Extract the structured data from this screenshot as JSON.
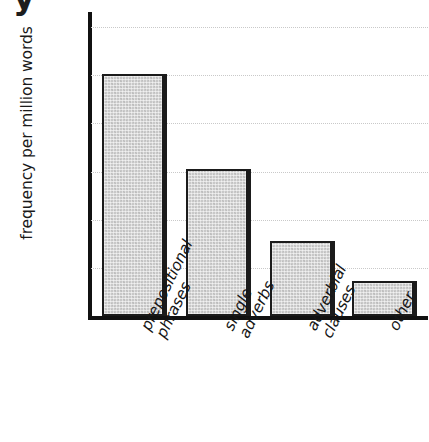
{
  "figure": {
    "cropped_caption_glyph": "y",
    "background_color": "#ffffff",
    "bar_fill_color": "#c8c8c8",
    "bar_edge_color": "#1b1b1b",
    "gridline_color": "#c9c9c9",
    "axis_color": "#111111"
  },
  "chart_data": {
    "type": "bar",
    "title": "",
    "xlabel": "",
    "ylabel": "frequency per million words",
    "categories": [
      "prepositional\nphrases",
      "single\nadverbs",
      "adverbial\nclauses",
      "other"
    ],
    "category_lines": [
      [
        "prepositional",
        "phrases"
      ],
      [
        "single",
        "adverbs"
      ],
      [
        "adverbial",
        "clauses"
      ],
      [
        "other"
      ]
    ],
    "values": [
      50200,
      30500,
      15500,
      7300
    ],
    "ylim": [
      0,
      62000
    ],
    "yticks": [
      0,
      10000,
      20000,
      30000,
      40000,
      50000,
      60000
    ],
    "ytick_labels": [
      "0",
      "10000",
      "20000",
      "30000",
      "40000",
      "50000",
      "60000"
    ],
    "grid": true,
    "grid_axis": "y",
    "legend": false,
    "legend_position": "none",
    "orientation": "vertical"
  }
}
